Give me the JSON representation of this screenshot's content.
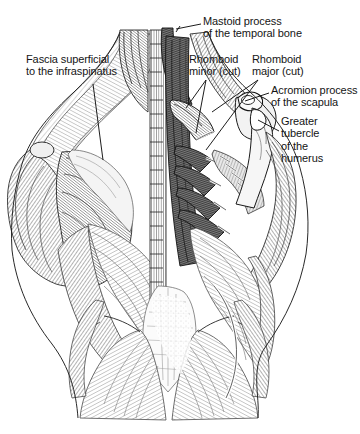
{
  "figure": {
    "background_color": "#ffffff",
    "ink_color": "#151515",
    "midtone_color": "#6e6e6e",
    "light_tone_color": "#b8b8b8",
    "width": 360,
    "height": 434
  },
  "labels": {
    "fascia": "Fascia superficial\nto the infraspinatus",
    "mastoid": "Mastoid process\nof the temporal bone",
    "rhomboid_minor": "Rhomboid\nminor (cut)",
    "rhomboid_major": "Rhomboid\nmajor (cut)",
    "acromion": "Acromion process\nof the scapula",
    "greater_tubercle": "Greater\ntubercle\nof the\nhumerus"
  },
  "leader_lines": [
    {
      "name": "fascia-leader",
      "from": [
        93,
        84
      ],
      "to": [
        103,
        160
      ]
    },
    {
      "name": "mastoid-leader",
      "from": [
        201,
        24
      ],
      "to": [
        178,
        29
      ]
    },
    {
      "name": "rhomboid-minor-leader",
      "from": [
        205,
        79
      ],
      "to": [
        187,
        107
      ]
    },
    {
      "name": "rhomboid-major-leader",
      "from": [
        258,
        79
      ],
      "to": [
        222,
        110
      ]
    },
    {
      "name": "acromion-leader",
      "from": [
        269,
        93
      ],
      "to": [
        243,
        102
      ]
    },
    {
      "name": "greater-tubercle-leader",
      "from": [
        279,
        130
      ],
      "to": [
        257,
        119
      ]
    }
  ]
}
